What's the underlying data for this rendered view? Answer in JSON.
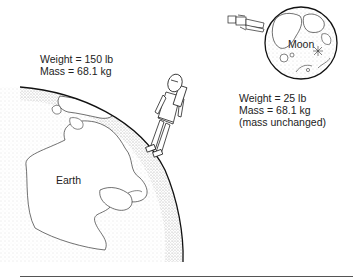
{
  "figure": {
    "earth": {
      "name": "Earth",
      "weight_text": "Weight = 150 lb",
      "mass_text": "Mass = 68.1 kg"
    },
    "moon": {
      "name": "Moon",
      "weight_text": "Weight = 25 lb",
      "mass_text": "Mass = 68.1 kg",
      "note": "(mass unchanged)"
    }
  },
  "colors": {
    "ink": "#1a1a1a",
    "stipple": "#9a9a9a",
    "background": "#ffffff",
    "divider": "#555555"
  }
}
